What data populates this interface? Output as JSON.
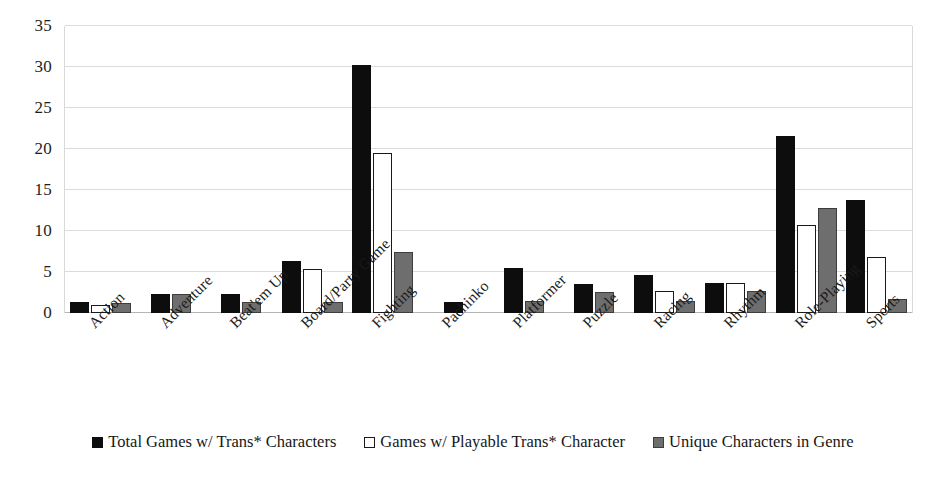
{
  "chart_data": {
    "type": "bar",
    "title": "",
    "subtitle": "",
    "xlabel": "",
    "ylabel": "",
    "ylim": [
      0,
      35
    ],
    "ytick_values": [
      0,
      5,
      10,
      15,
      20,
      25,
      30,
      35
    ],
    "ytick_labels": [
      "0",
      "5",
      "10",
      "15",
      "20",
      "25",
      "30",
      "35"
    ],
    "grid": true,
    "grid_axis": "y",
    "legend_position": "bottom",
    "categories": [
      "Action",
      "Adventure",
      "Beat'em Up",
      "Board/Party Game",
      "Fighting",
      "Pachinko",
      "Platformer",
      "Puzzle",
      "Racing",
      "Rhythm",
      "Role-Playing",
      "Sports"
    ],
    "series": [
      {
        "name": "Total Games w/ Trans* Characters",
        "color": "#0d0d0d",
        "values": [
          1.3,
          2.3,
          2.3,
          6.4,
          30.3,
          1.4,
          5.5,
          3.5,
          4.6,
          3.7,
          21.6,
          13.8
        ]
      },
      {
        "name": "Games w/ Playable Trans* Character",
        "color": "#ffffff",
        "values": [
          1.0,
          0,
          0,
          5.4,
          19.5,
          0,
          0,
          0,
          2.7,
          3.7,
          10.7,
          6.8
        ]
      },
      {
        "name": "Unique Characters in Genre",
        "color": "#6e6e6e",
        "values": [
          1.2,
          2.3,
          1.3,
          1.4,
          7.5,
          0,
          1.5,
          2.6,
          1.5,
          2.7,
          12.8,
          1.7
        ]
      }
    ]
  },
  "legend": {
    "items": [
      {
        "label": "Total Games w/ Trans* Characters",
        "swatch": "filled-black-square-icon"
      },
      {
        "label": "Games w/ Playable Trans* Character",
        "swatch": "outlined-white-square-icon"
      },
      {
        "label": "Unique Characters in Genre",
        "swatch": "filled-gray-square-icon"
      }
    ]
  },
  "colors": {
    "series_black": "#0d0d0d",
    "series_white": "#ffffff",
    "series_gray": "#6e6e6e",
    "gridline": "#dcdcdc",
    "axis": "#b5b5b5",
    "background": "#ffffff",
    "text": "#1a1a1a"
  }
}
